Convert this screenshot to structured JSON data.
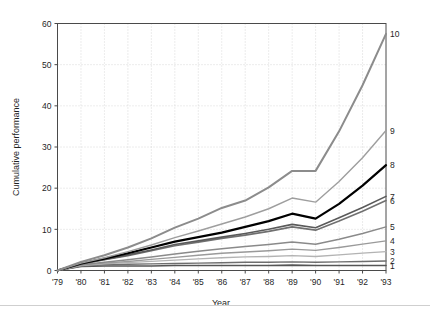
{
  "chart_data": {
    "type": "line",
    "title": "",
    "xlabel": "Year",
    "ylabel": "Cumulative performance",
    "grid": true,
    "legend_position": "right-end-labels",
    "xlim": [
      1979,
      1993
    ],
    "ylim": [
      0,
      60
    ],
    "yticks": [
      0,
      10,
      20,
      30,
      40,
      50,
      60
    ],
    "ytick_labels": [
      "0",
      "10",
      "20",
      "30",
      "40",
      "50",
      "60"
    ],
    "x": [
      1979,
      1980,
      1981,
      1982,
      1983,
      1984,
      1985,
      1986,
      1987,
      1988,
      1989,
      1990,
      1991,
      1992,
      1993
    ],
    "xtick_labels": [
      "'79",
      "'80",
      "'81",
      "'82",
      "'83",
      "'84",
      "'85",
      "'86",
      "'87",
      "'88",
      "'89",
      "'90",
      "'91",
      "'92",
      "'93"
    ],
    "series": [
      {
        "name": "1",
        "label": "1",
        "color": "#555555",
        "width": 1.6,
        "values": [
          0.0,
          1.0,
          1.1,
          1.1,
          1.1,
          1.2,
          1.2,
          1.2,
          1.2,
          1.2,
          1.3,
          1.2,
          1.2,
          1.2,
          1.2
        ]
      },
      {
        "name": "2",
        "label": "2",
        "color": "#6e6e6e",
        "width": 1.4,
        "values": [
          0.0,
          1.1,
          1.4,
          1.5,
          1.6,
          1.7,
          1.8,
          1.9,
          2.0,
          2.0,
          2.1,
          2.0,
          2.1,
          2.2,
          2.3
        ]
      },
      {
        "name": "3",
        "label": "3",
        "color": "#b3b3b3",
        "width": 1.3,
        "values": [
          0.0,
          1.2,
          1.6,
          1.9,
          2.2,
          2.5,
          2.8,
          3.1,
          3.3,
          3.4,
          3.6,
          3.4,
          3.8,
          4.2,
          4.6
        ]
      },
      {
        "name": "4",
        "label": "4",
        "color": "#9a9a9a",
        "width": 1.4,
        "values": [
          0.0,
          1.3,
          1.8,
          2.2,
          2.7,
          3.2,
          3.7,
          4.2,
          4.5,
          4.8,
          5.2,
          4.9,
          5.6,
          6.4,
          7.2
        ]
      },
      {
        "name": "5",
        "label": "5",
        "color": "#8a8a8a",
        "width": 1.5,
        "values": [
          0.0,
          1.4,
          2.0,
          2.6,
          3.3,
          4.0,
          4.7,
          5.3,
          5.8,
          6.3,
          6.9,
          6.4,
          7.6,
          9.0,
          10.6
        ]
      },
      {
        "name": "6",
        "label": "6",
        "color": "#707070",
        "width": 1.6,
        "values": [
          0.0,
          1.6,
          2.6,
          3.6,
          4.8,
          6.0,
          6.9,
          7.8,
          8.6,
          9.5,
          10.6,
          9.8,
          12.0,
          14.4,
          17.0
        ]
      },
      {
        "name": "7",
        "label": "7",
        "color": "#5a5a5a",
        "width": 1.6,
        "values": [
          0.0,
          1.6,
          2.7,
          3.8,
          5.0,
          6.3,
          7.2,
          8.1,
          9.0,
          10.0,
          11.2,
          10.4,
          12.8,
          15.3,
          18.0
        ]
      },
      {
        "name": "8",
        "label": "8",
        "color": "#000000",
        "width": 2.2,
        "values": [
          0.0,
          1.7,
          2.9,
          4.2,
          5.6,
          7.0,
          8.1,
          9.2,
          10.6,
          12.0,
          13.8,
          12.6,
          16.2,
          20.6,
          25.6
        ]
      },
      {
        "name": "9",
        "label": "9",
        "color": "#9e9e9e",
        "width": 1.4,
        "values": [
          0.0,
          1.8,
          3.1,
          4.6,
          6.2,
          8.0,
          9.6,
          11.3,
          13.0,
          15.0,
          17.6,
          16.6,
          21.6,
          27.4,
          34.0
        ]
      },
      {
        "name": "10",
        "label": "10",
        "color": "#8c8c8c",
        "width": 2.0,
        "values": [
          0.0,
          2.1,
          3.7,
          5.6,
          7.8,
          10.4,
          12.6,
          15.2,
          17.0,
          20.2,
          24.2,
          24.2,
          33.8,
          45.0,
          57.5
        ]
      }
    ]
  }
}
